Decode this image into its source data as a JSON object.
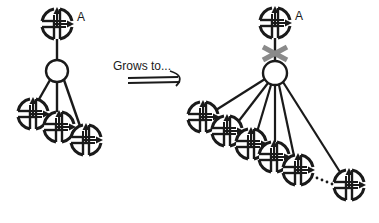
{
  "diagram": {
    "arrow_label": "Grows to...",
    "colors": {
      "ink": "#1a1a1a",
      "cross": "#8a8a8a",
      "node_fill": "#ffffff"
    },
    "before": {
      "root_label": "A",
      "root": [
        57,
        24
      ],
      "hub": [
        57,
        71
      ],
      "children": [
        [
          33,
          114
        ],
        [
          59,
          127
        ],
        [
          86,
          140
        ]
      ]
    },
    "after": {
      "root_label": "A",
      "root": [
        275,
        23
      ],
      "hub": [
        275,
        73
      ],
      "link_removed": true,
      "children": [
        [
          203,
          117
        ],
        [
          227,
          131
        ],
        [
          251,
          144
        ],
        [
          274,
          157
        ],
        [
          298,
          170
        ],
        [
          349,
          185
        ]
      ],
      "ellipsis_between": [
        4,
        5
      ]
    }
  }
}
